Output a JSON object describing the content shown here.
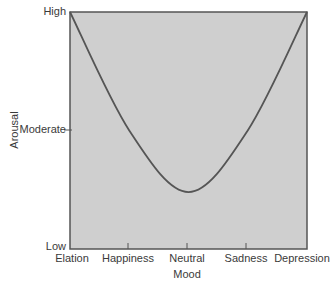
{
  "chart_data": {
    "type": "line",
    "title": "",
    "xlabel": "Mood",
    "ylabel": "Arousal",
    "categories": [
      "Elation",
      "Happiness",
      "Neutral",
      "Sadness",
      "Depression"
    ],
    "y_tick_labels": [
      "Low",
      "Moderate",
      "High"
    ],
    "y_scale_note": "qualitative: Low=0, Moderate=0.5, High=1",
    "series": [
      {
        "name": "Arousal vs Mood",
        "values": [
          1.0,
          0.5,
          0.24,
          0.5,
          1.0
        ]
      }
    ],
    "ylim": [
      0,
      1
    ],
    "grid": false,
    "legend": "none",
    "colors": {
      "plot_fill": "#cfcfcf",
      "line": "#555555",
      "frame": "#555555"
    }
  },
  "labels": {
    "y_high": "High",
    "y_moderate": "Moderate",
    "y_low": "Low",
    "x_elation": "Elation",
    "x_happiness": "Happiness",
    "x_neutral": "Neutral",
    "x_sadness": "Sadness",
    "x_depression": "Depression",
    "x_title": "Mood",
    "y_title": "Arousal"
  }
}
